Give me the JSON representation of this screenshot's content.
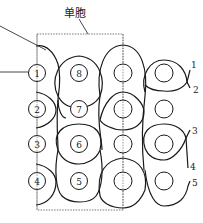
{
  "diagram": {
    "title": "单胞",
    "unit_cell_box": {
      "x": 37,
      "y": 33,
      "width": 86,
      "height": 177
    },
    "columns_x": [
      37,
      79,
      123,
      164
    ],
    "rows_y": [
      73,
      109,
      144,
      181
    ],
    "weft_circles": [
      {
        "col": 0,
        "row": 0,
        "label": "1"
      },
      {
        "col": 0,
        "row": 1,
        "label": "2"
      },
      {
        "col": 0,
        "row": 2,
        "label": "3"
      },
      {
        "col": 0,
        "row": 3,
        "label": "4"
      },
      {
        "col": 1,
        "row": 0,
        "label": "8"
      },
      {
        "col": 1,
        "row": 1,
        "label": "7"
      },
      {
        "col": 1,
        "row": 2,
        "label": "6"
      },
      {
        "col": 1,
        "row": 3,
        "label": "5"
      },
      {
        "col": 2,
        "row": 0,
        "label": ""
      },
      {
        "col": 2,
        "row": 1,
        "label": ""
      },
      {
        "col": 2,
        "row": 2,
        "label": ""
      },
      {
        "col": 2,
        "row": 3,
        "label": ""
      },
      {
        "col": 3,
        "row": 0,
        "label": ""
      },
      {
        "col": 3,
        "row": 1,
        "label": ""
      },
      {
        "col": 3,
        "row": 2,
        "label": ""
      },
      {
        "col": 3,
        "row": 3,
        "label": ""
      }
    ],
    "warp_labels": [
      {
        "label": "1",
        "x": 189,
        "y": 66
      },
      {
        "label": "2",
        "x": 193,
        "y": 91
      },
      {
        "label": "3",
        "x": 192,
        "y": 133
      },
      {
        "label": "4",
        "x": 190,
        "y": 167
      },
      {
        "label": "5",
        "x": 193,
        "y": 184
      }
    ],
    "line_color": "#1a1a1a",
    "dash_color": "#555555"
  }
}
